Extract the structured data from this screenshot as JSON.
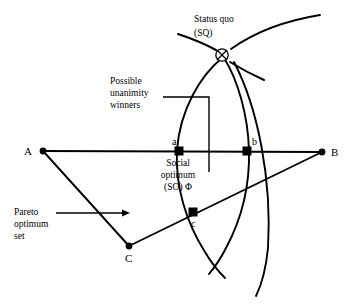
{
  "figure": {
    "title_present": false,
    "background_color": "#ffffff",
    "line_color": "#000000",
    "width": 354,
    "height": 306
  },
  "annotations": {
    "status_quo": {
      "line1": "Status quo",
      "line2": "(SQ)",
      "marker": "circle-with-x"
    },
    "possible_unanimity": {
      "line1": "Possible",
      "line2": "unanimity",
      "line3": "winners"
    },
    "social_optimum": {
      "line1": "Social",
      "line2": "optimum",
      "line3": "(SO) Φ"
    },
    "pareto": {
      "line1": "Pareto",
      "line2": "optimum",
      "line3": "set"
    }
  },
  "vertices": [
    {
      "id": "A",
      "label": "A",
      "x": 43,
      "y": 151,
      "label_x": 24,
      "label_y": 155,
      "marker": "dot"
    },
    {
      "id": "B",
      "label": "B",
      "x": 322,
      "y": 152,
      "label_x": 331,
      "label_y": 156,
      "marker": "dot"
    },
    {
      "id": "C",
      "label": "C",
      "x": 129,
      "y": 246,
      "label_x": 125,
      "label_y": 262,
      "marker": "dot"
    }
  ],
  "points": [
    {
      "id": "a",
      "label": "a",
      "x": 179,
      "y": 151,
      "label_x": 172,
      "label_y": 145,
      "marker": "square"
    },
    {
      "id": "b",
      "label": "b",
      "x": 247,
      "y": 151,
      "label_x": 252,
      "label_y": 145,
      "marker": "square"
    },
    {
      "id": "c",
      "label": "c",
      "x": 193,
      "y": 212,
      "label_x": 191,
      "label_y": 227,
      "marker": "square"
    },
    {
      "id": "SQ",
      "label": "",
      "x": 222,
      "y": 55,
      "label_x": 0,
      "label_y": 0,
      "marker": "circle-with-x"
    }
  ],
  "text_positions": {
    "status_quo_x": 194,
    "status_quo_y1": 22,
    "status_quo_y2": 36,
    "possible_x": 110,
    "possible_y1": 84,
    "possible_y2": 96,
    "possible_y3": 108,
    "social_x": 178,
    "social_y1": 166,
    "social_y2": 178,
    "social_y3": 190,
    "pareto_x": 14,
    "pareto_y1": 215,
    "pareto_y2": 227,
    "pareto_y3": 239
  },
  "segments": {
    "AB": {
      "x1": 43,
      "y1": 151,
      "x2": 322,
      "y2": 152
    },
    "AC": {
      "x1": 43,
      "y1": 151,
      "x2": 129,
      "y2": 246
    },
    "CB": {
      "x1": 129,
      "y1": 246,
      "x2": 322,
      "y2": 152
    }
  },
  "leaders": {
    "unanimity": {
      "x1": 163,
      "y1": 97,
      "x2": 209,
      "y2": 97,
      "x3": 209,
      "y3": 172
    },
    "pareto_arrow": {
      "x1": 56,
      "y1": 213,
      "x2": 130,
      "y2": 213
    }
  },
  "curves": {
    "left_indifference": "M 222 58 C 200 76, 180 110, 177 150 C 175 186, 186 222, 205 252 C 212 264, 219 272, 225 278",
    "right_indifference": "M 224 58 C 238 80, 248 116, 249 150 C 250 188, 240 222, 226 248 C 220 260, 214 268, 209 274",
    "outer_arc": "M 231 49 C 252 34, 283 21, 320 15",
    "outer_arc_lower": "M 234 62 C 258 108, 272 180, 268 248 C 266 268, 262 284, 256 296",
    "sq_spoke_upleft": "M 216 50 C 205 44, 190 38, 178 34",
    "sq_spoke_downright": "M 230 62 C 243 70, 255 76, 264 80"
  },
  "colors": {
    "ink": "#000000",
    "paper": "#ffffff"
  }
}
